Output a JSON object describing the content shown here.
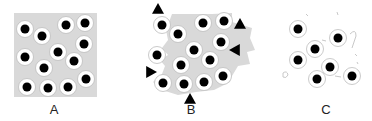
{
  "panels": [
    {
      "label": "A",
      "label_x": 54,
      "background": "square",
      "dots": [
        [
          25,
          29
        ],
        [
          42,
          36
        ],
        [
          66,
          25
        ],
        [
          85,
          23
        ],
        [
          84,
          44
        ],
        [
          58,
          52
        ],
        [
          25,
          57
        ],
        [
          44,
          68
        ],
        [
          74,
          61
        ],
        [
          86,
          79
        ],
        [
          27,
          87
        ],
        [
          48,
          88
        ],
        [
          68,
          87
        ]
      ],
      "triangles": []
    },
    {
      "label": "B",
      "label_x": 191,
      "background": "irregular",
      "dots": [
        [
          162,
          25
        ],
        [
          178,
          34
        ],
        [
          203,
          23
        ],
        [
          224,
          21
        ],
        [
          221,
          42
        ],
        [
          194,
          50
        ],
        [
          157,
          55
        ],
        [
          181,
          65
        ],
        [
          210,
          60
        ],
        [
          223,
          76
        ],
        [
          163,
          83
        ],
        [
          184,
          84
        ],
        [
          204,
          82
        ]
      ],
      "triangles": [
        {
          "x": 158,
          "y": 9,
          "dir": "up"
        },
        {
          "x": 240,
          "y": 24,
          "dir": "up"
        },
        {
          "x": 235,
          "y": 50,
          "dir": "left"
        },
        {
          "x": 151,
          "y": 72,
          "dir": "right"
        },
        {
          "x": 190,
          "y": 99,
          "dir": "up"
        }
      ]
    },
    {
      "label": "C",
      "label_x": 326,
      "background": "fragments",
      "dots": [
        [
          298,
          29
        ],
        [
          338,
          38
        ],
        [
          315,
          49
        ],
        [
          298,
          60
        ],
        [
          330,
          67
        ],
        [
          317,
          79
        ],
        [
          352,
          76
        ]
      ],
      "triangles": []
    }
  ],
  "colors": {
    "gray": "#d9d9d9",
    "dot": "#000000",
    "ring": "#ffffff",
    "ring_edge": "#bdbdbd",
    "triangle": "#000000"
  }
}
